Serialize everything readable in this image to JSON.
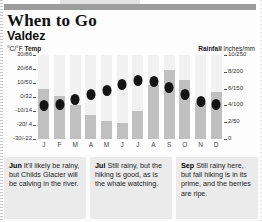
{
  "header": {
    "title": "When to Go",
    "subtitle": "Valdez",
    "rule": "top-rule"
  },
  "chart_legend": {
    "left_units": "°C/°F",
    "left_label": "Temp",
    "right_label": "Rainfall",
    "right_units": "inches/mm"
  },
  "chart_data": {
    "type": "bar",
    "title": "Valdez",
    "xlabel": "",
    "ylabel": "Temp (°C/°F)",
    "y2label": "Rainfall (inches/mm)",
    "categories": [
      "J",
      "F",
      "M",
      "A",
      "M",
      "J",
      "J",
      "A",
      "S",
      "O",
      "N",
      "D"
    ],
    "month_names": [
      "January",
      "February",
      "March",
      "April",
      "May",
      "June",
      "July",
      "August",
      "September",
      "October",
      "November",
      "December"
    ],
    "grid": false,
    "legend": "none",
    "ylim": [
      -30,
      30
    ],
    "y2lim": [
      0,
      10
    ],
    "yticks": [
      "30/86",
      "20/68",
      "10/50",
      "0/32",
      "-10/14",
      "-20/ 4",
      "-30/-22"
    ],
    "ytick_values": [
      30,
      20,
      10,
      0,
      -10,
      -20,
      -30
    ],
    "y2ticks": [
      "10/250",
      "8/200",
      "6/150",
      "4/100",
      "2/50",
      "0"
    ],
    "y2tick_values": [
      10,
      8,
      6,
      4,
      2,
      0
    ],
    "series": [
      {
        "name": "Rainfall",
        "type": "bar",
        "units": "inches",
        "values": [
          6.0,
          5.1,
          4.0,
          2.9,
          2.2,
          1.9,
          3.3,
          6.4,
          8.2,
          7.0,
          4.3,
          5.6
        ]
      },
      {
        "name": "Temp",
        "type": "scatter",
        "units": "°C",
        "values": [
          -6,
          -5,
          -2,
          2,
          5,
          9,
          12,
          11,
          7,
          2,
          -3,
          -5
        ]
      }
    ]
  },
  "notes": [
    {
      "month": "Jun",
      "text": " It'll likely be rainy, but Childs Glacier will be calving in the river."
    },
    {
      "month": "Jul",
      "text": " Still rainy, but the hiking is good, as is the whale watching."
    },
    {
      "month": "Sep",
      "text": " Still rainy here, but fall hiking is in its prime, and the berries are ripe."
    }
  ]
}
